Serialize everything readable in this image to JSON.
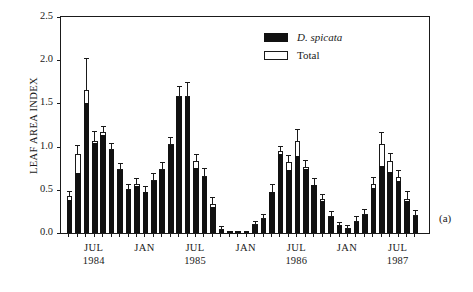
{
  "axes": {
    "ylabel": "LEAF AREA INDEX",
    "yticks": [
      "0.0",
      "0.5",
      "1.0",
      "1.5",
      "2.0",
      "2.5"
    ],
    "ylim": [
      0,
      2.5
    ]
  },
  "legend": {
    "items": [
      {
        "label": "D. spicata",
        "style": "filled",
        "color": "#111111",
        "italic": true
      },
      {
        "label": "Total",
        "style": "open",
        "color": "#ffffff",
        "italic": false
      }
    ]
  },
  "panel": {
    "label": "(a)"
  },
  "xaxis": {
    "labels": [
      {
        "month": "JUL",
        "year": "1984",
        "index": 3
      },
      {
        "month": "JAN",
        "year": "",
        "index": 9
      },
      {
        "month": "JUL",
        "year": "1985",
        "index": 15
      },
      {
        "month": "JAN",
        "year": "",
        "index": 21
      },
      {
        "month": "JUL",
        "year": "1986",
        "index": 27
      },
      {
        "month": "JAN",
        "year": "",
        "index": 33
      },
      {
        "month": "JUL",
        "year": "1987",
        "index": 39
      }
    ]
  },
  "chart_data": {
    "type": "bar",
    "title": "",
    "xlabel": "",
    "ylabel": "LEAF AREA INDEX",
    "ylim": [
      0,
      2.5
    ],
    "grid": false,
    "legend_position": "top-center",
    "categories": [
      "1984-05",
      "1984-06",
      "1984-07",
      "1984-08",
      "1984-09",
      "1984-10",
      "1984-11",
      "1984-12",
      "1985-01",
      "1985-02",
      "1985-03",
      "1985-04",
      "1985-05",
      "1985-06",
      "1985-07",
      "1985-08",
      "1985-09",
      "1985-10",
      "1985-11",
      "1985-12",
      "1986-01",
      "1986-02",
      "1986-03",
      "1986-04",
      "1986-05",
      "1986-06",
      "1986-07",
      "1986-08",
      "1986-09",
      "1986-10",
      "1986-11",
      "1986-12",
      "1987-01",
      "1987-02",
      "1987-03",
      "1987-04",
      "1987-05",
      "1987-06",
      "1987-07",
      "1987-08",
      "1987-09",
      "1987-10"
    ],
    "series": [
      {
        "name": "D. spicata",
        "color": "#111111",
        "values": [
          0.38,
          0.7,
          1.5,
          1.04,
          1.13,
          0.96,
          0.73,
          0.5,
          0.54,
          0.47,
          0.6,
          0.73,
          1.02,
          1.57,
          1.57,
          0.75,
          0.65,
          0.3,
          0.04,
          0.02,
          0.01,
          0.01,
          0.09,
          0.16,
          0.47,
          0.92,
          0.73,
          0.89,
          0.74,
          0.55,
          0.37,
          0.18,
          0.08,
          0.05,
          0.13,
          0.21,
          0.52,
          0.78,
          0.71,
          0.6,
          0.37,
          0.2
        ],
        "errors": [
          0.05,
          0.22,
          0.52,
          0.42,
          0.09,
          0.08,
          0.08,
          0.05,
          0.06,
          0.06,
          0.09,
          0.09,
          0.09,
          0.15,
          0.22,
          0.09,
          0.09,
          0.07,
          0.02,
          0.01,
          0.01,
          0.01,
          0.03,
          0.04,
          0.09,
          0.06,
          0.09,
          0.19,
          0.09,
          0.07,
          0.06,
          0.04,
          0.03,
          0.02,
          0.04,
          0.05,
          0.08,
          0.25,
          0.11,
          0.08,
          0.1,
          0.05
        ]
      },
      {
        "name": "Total",
        "color": "#ffffff",
        "values": [
          0.43,
          0.92,
          1.65,
          1.06,
          1.17,
          0.97,
          0.74,
          0.51,
          0.57,
          0.48,
          0.61,
          0.74,
          1.03,
          1.59,
          1.59,
          0.83,
          0.66,
          0.34,
          0.05,
          0.02,
          0.01,
          0.01,
          0.1,
          0.17,
          0.48,
          0.95,
          0.82,
          1.07,
          0.76,
          0.56,
          0.39,
          0.2,
          0.09,
          0.06,
          0.14,
          0.22,
          0.57,
          1.03,
          0.83,
          0.65,
          0.39,
          0.21
        ],
        "errors": [
          0.04,
          0.09,
          0.36,
          0.11,
          0.06,
          0.06,
          0.06,
          0.05,
          0.05,
          0.05,
          0.07,
          0.07,
          0.07,
          0.1,
          0.15,
          0.07,
          0.08,
          0.06,
          0.02,
          0.01,
          0.01,
          0.01,
          0.03,
          0.04,
          0.07,
          0.05,
          0.07,
          0.12,
          0.07,
          0.06,
          0.05,
          0.04,
          0.03,
          0.02,
          0.04,
          0.05,
          0.07,
          0.13,
          0.08,
          0.07,
          0.09,
          0.05
        ]
      }
    ]
  }
}
